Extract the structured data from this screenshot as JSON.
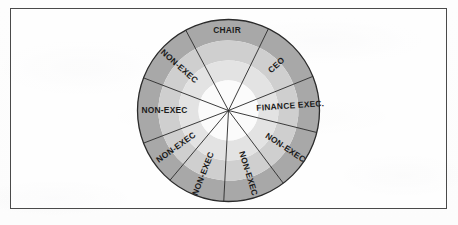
{
  "figure": {
    "kind": "board-composition-wheel",
    "title_visible": false
  },
  "frame": {
    "border_color": "#4a4a4a",
    "background": "#ffffff"
  },
  "wheel": {
    "center_x": 228.5,
    "center_y": 110.5,
    "radius": 91,
    "bands": [
      {
        "name": "outer-band",
        "outer_r": 91,
        "inner_r": 70,
        "color": "#a8a8a8"
      },
      {
        "name": "mid-band",
        "outer_r": 70,
        "inner_r": 50,
        "color": "#cfcfcf"
      },
      {
        "name": "inner-band",
        "outer_r": 50,
        "inner_r": 30,
        "color": "#e3e3e3"
      },
      {
        "name": "core",
        "outer_r": 30,
        "inner_r": 0,
        "color": "#fbfbfb"
      }
    ],
    "spoke_color": "#262626",
    "outline_color": "#2b2b2b"
  },
  "chart_data": {
    "type": "pie",
    "title": "",
    "categories": [
      "CHAIR",
      "CEO",
      "FINANCE EXEC.",
      "NON-EXEC",
      "NON-EXEC",
      "NON-EXEC",
      "NON-EXEC",
      "NON-EXEC",
      "NON-EXEC"
    ],
    "values": [
      1,
      1,
      1,
      1,
      1,
      1,
      1,
      1,
      1
    ],
    "legend": "none"
  },
  "segments": [
    {
      "id": "chair",
      "label": "CHAIR",
      "start_deg": -28,
      "end_deg": 26,
      "label_r": 80,
      "upright": true
    },
    {
      "id": "ceo",
      "label": "CEO",
      "start_deg": 26,
      "end_deg": 68,
      "label_r": 66,
      "upright": false
    },
    {
      "id": "finance-exec",
      "label": "FINANCE EXEC.",
      "start_deg": 68,
      "end_deg": 104,
      "label_r": 62,
      "upright": false
    },
    {
      "id": "non-exec-1",
      "label": "NON-EXEC",
      "start_deg": 104,
      "end_deg": 143,
      "label_r": 68,
      "upright": false
    },
    {
      "id": "non-exec-2",
      "label": "NON-EXEC",
      "start_deg": 143,
      "end_deg": 183,
      "label_r": 66,
      "upright": false
    },
    {
      "id": "non-exec-3",
      "label": "NON-EXEC",
      "start_deg": 183,
      "end_deg": 220,
      "label_r": 68,
      "upright": false
    },
    {
      "id": "non-exec-4",
      "label": "NON-EXEC",
      "start_deg": 220,
      "end_deg": 249,
      "label_r": 64,
      "upright": false
    },
    {
      "id": "non-exec-5",
      "label": "NON-EXEC",
      "start_deg": 249,
      "end_deg": 291,
      "label_r": 64,
      "upright": false
    },
    {
      "id": "non-exec-6",
      "label": "NON-EXEC",
      "start_deg": 291,
      "end_deg": 332,
      "label_r": 66,
      "upright": false
    }
  ]
}
